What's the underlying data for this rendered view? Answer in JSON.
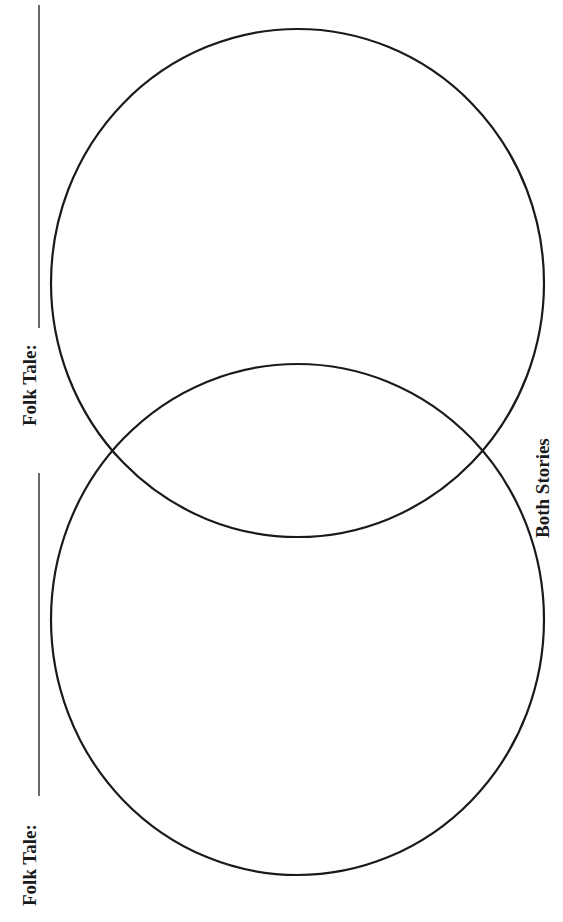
{
  "worksheet": {
    "type": "Venn diagram (two overlapping circles, page rotated 90°)",
    "labels": {
      "top_folk_tale": "Folk Tale:",
      "bottom_folk_tale": "Folk Tale:",
      "overlap": "Both Stories"
    },
    "fields": {
      "top_folk_tale_value": "",
      "bottom_folk_tale_value": ""
    },
    "colors": {
      "ink": "#1a1a1a",
      "paper": "#ffffff"
    }
  }
}
